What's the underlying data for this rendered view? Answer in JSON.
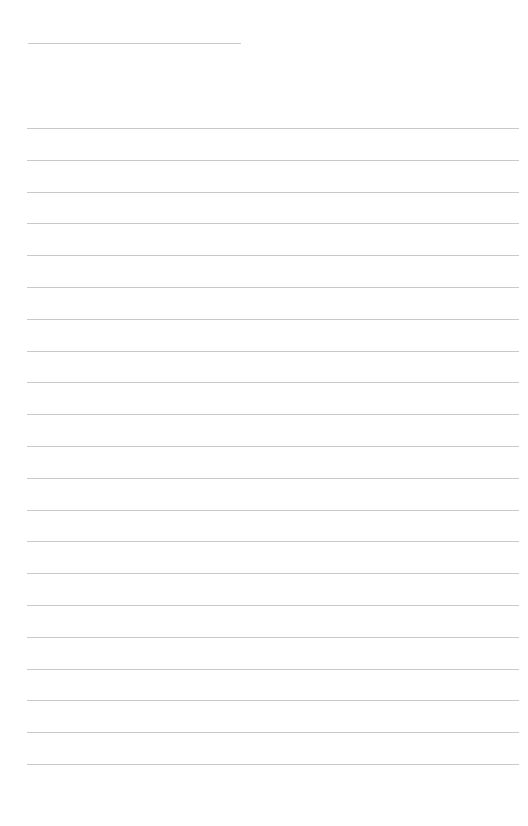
{
  "page": {
    "kind": "blank-ruled-note-page",
    "background_color": "#ffffff",
    "width": 528,
    "height": 826
  },
  "title_field": {
    "value": "",
    "placeholder": "",
    "rule_color": "#c9c9cd",
    "left": 28,
    "top": 30,
    "width": 213
  },
  "ruled_lines": {
    "color": "#c9c9cd",
    "thickness": 1,
    "left": 27,
    "right": 519,
    "first_y": 128,
    "spacing": 31.8,
    "count": 21,
    "values": [
      "",
      "",
      "",
      "",
      "",
      "",
      "",
      "",
      "",
      "",
      "",
      "",
      "",
      "",
      "",
      "",
      "",
      "",
      "",
      "",
      ""
    ]
  }
}
